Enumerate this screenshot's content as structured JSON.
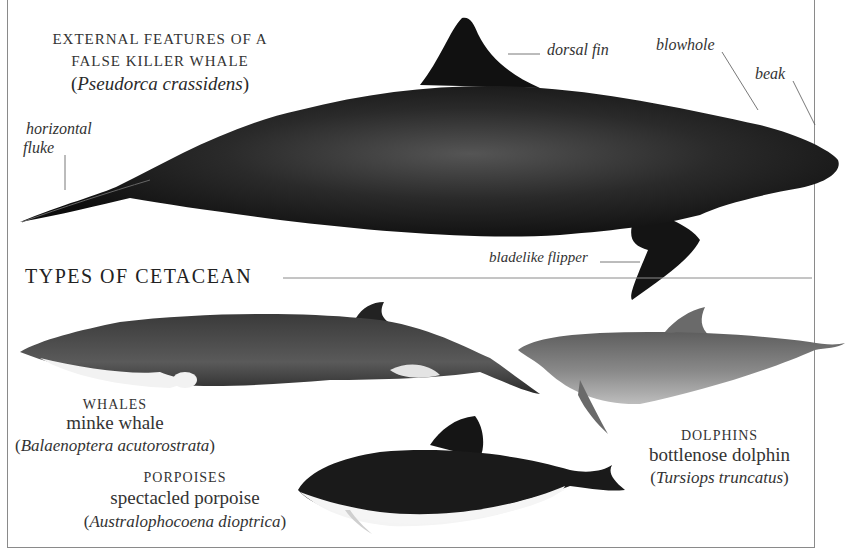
{
  "top_feature": {
    "title_line1": "EXTERNAL FEATURES OF A",
    "title_line2": "FALSE KILLER WHALE",
    "scientific_name": "Pseudorca crassidens",
    "labels": {
      "dorsal_fin": "dorsal fin",
      "blowhole": "blowhole",
      "beak": "beak",
      "horizontal_fluke_line1": "horizontal",
      "horizontal_fluke_line2": "fluke",
      "bladelike_flipper": "bladelike flipper"
    }
  },
  "section": {
    "title": "TYPES OF CETACEAN"
  },
  "types": [
    {
      "group": "WHALES",
      "common_name": "minke whale",
      "scientific_name": "Balaenoptera acutorostrata"
    },
    {
      "group": "PORPOISES",
      "common_name": "spectacled porpoise",
      "scientific_name": "Australophocoena dioptrica"
    },
    {
      "group": "DOLPHINS",
      "common_name": "bottlenose dolphin",
      "scientific_name": "Tursiops truncatus"
    }
  ],
  "colors": {
    "ink": "#111111",
    "minke_body": "#4a4a4a",
    "dolphin_body": "#7a7a7a",
    "belly": "#f4f4f4",
    "rule": "#8a8a8a"
  },
  "parens": {
    "open": "(",
    "close": ")"
  }
}
